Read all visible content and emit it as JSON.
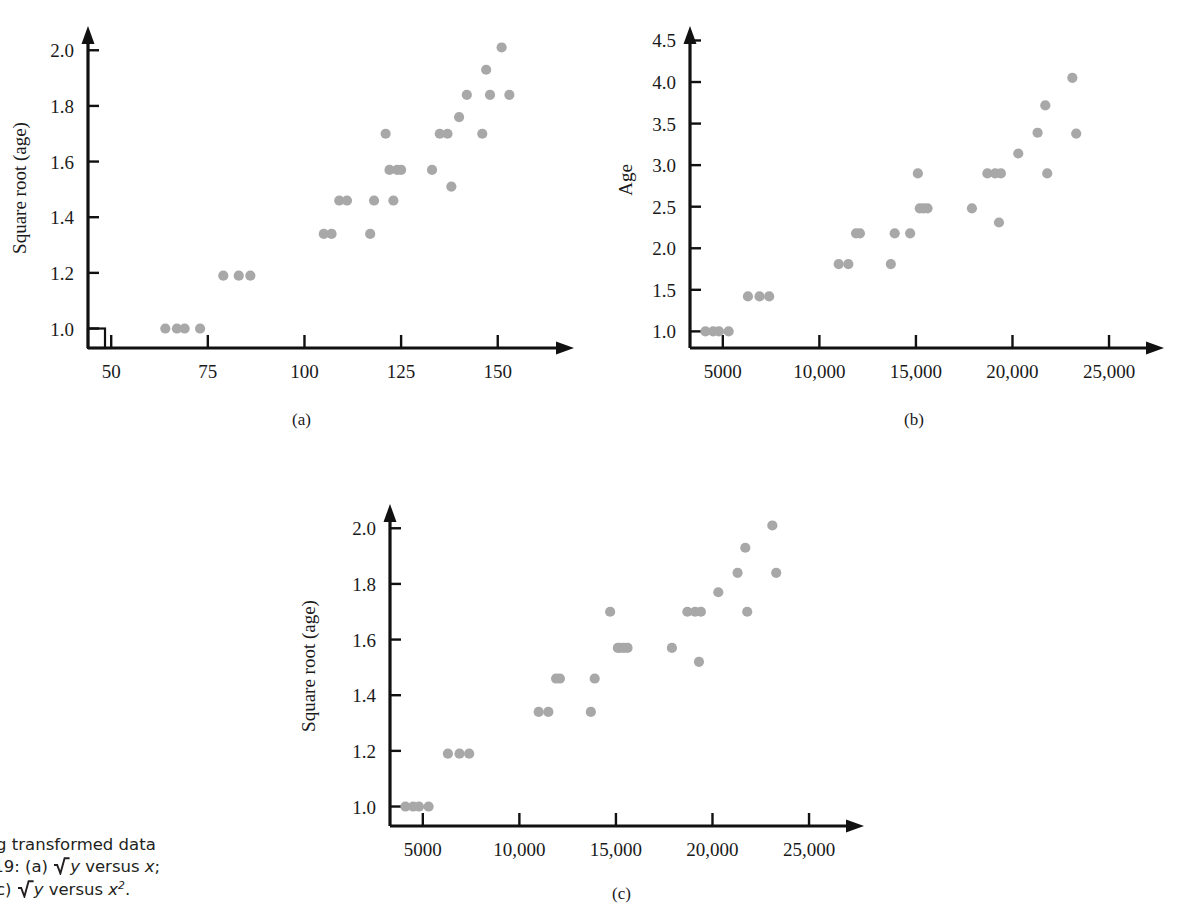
{
  "figure": {
    "number": "40",
    "caption_lines": [
      "using transformed data",
      "e 5.19: (a) √y versus x;",
      "x²; (c) √y versus x²."
    ],
    "caption_plain": "Figure 5.40  Scatterplots using transformed data for the data of Figure 5.19: (a) √y versus x; (b) y versus x²; (c) √y versus x²."
  },
  "style": {
    "marker_color": "#a8a8a8",
    "axis_color": "#111111",
    "background": "#ffffff"
  },
  "panels": [
    {
      "key": "a",
      "letter": "(a)"
    },
    {
      "key": "b",
      "letter": "(b)"
    },
    {
      "key": "c",
      "letter": "(c)"
    }
  ],
  "chart_data": [
    {
      "type": "scatter",
      "panel": "(a)",
      "title": "",
      "xlabel": "Carapace length",
      "ylabel": "Square root (age)",
      "xlim": [
        44,
        163
      ],
      "ylim": [
        0.93,
        2.08
      ],
      "xticks": [
        50,
        75,
        100,
        125,
        150
      ],
      "xticklabels": [
        "50",
        "75",
        "100",
        "125",
        "150"
      ],
      "yticks": [
        1.0,
        1.2,
        1.4,
        1.6,
        1.8,
        2.0
      ],
      "yticklabels": [
        "1.0",
        "1.2",
        "1.4",
        "1.6",
        "1.8",
        "2.0"
      ],
      "axis_break": true,
      "grid": false,
      "legend": "none",
      "x": [
        64,
        67,
        69,
        73,
        79,
        83,
        86,
        105,
        107,
        109,
        111,
        117,
        118,
        121,
        122,
        123,
        124,
        125,
        133,
        135,
        137,
        138,
        140,
        142,
        146,
        147,
        148,
        151,
        153
      ],
      "y": [
        1.0,
        1.0,
        1.0,
        1.0,
        1.19,
        1.19,
        1.19,
        1.34,
        1.34,
        1.46,
        1.46,
        1.34,
        1.46,
        1.7,
        1.57,
        1.46,
        1.57,
        1.57,
        1.57,
        1.7,
        1.7,
        1.51,
        1.76,
        1.84,
        1.7,
        1.93,
        1.84,
        2.01,
        1.84
      ]
    },
    {
      "type": "scatter",
      "panel": "(b)",
      "title": "",
      "xlabel": "Length squared",
      "ylabel": "Age",
      "xlim": [
        3300,
        26500
      ],
      "ylim": [
        0.8,
        4.65
      ],
      "xticks": [
        5000,
        10000,
        15000,
        20000,
        25000
      ],
      "xticklabels": [
        "5000",
        "10,000",
        "15,000",
        "20,000",
        "25,000"
      ],
      "yticks": [
        1.0,
        1.5,
        2.0,
        2.5,
        3.0,
        3.5,
        4.0,
        4.5
      ],
      "yticklabels": [
        "1.0",
        "1.5",
        "2.0",
        "2.5",
        "3.0",
        "3.5",
        "4.0",
        "4.5"
      ],
      "axis_break": false,
      "grid": false,
      "legend": "none",
      "x": [
        4100,
        4500,
        4800,
        5300,
        6300,
        6900,
        7400,
        11000,
        11500,
        11900,
        12100,
        13700,
        13900,
        14700,
        15100,
        15200,
        15400,
        15600,
        17900,
        18700,
        19100,
        19300,
        19400,
        20300,
        21300,
        21700,
        21800,
        23100,
        23300
      ],
      "y": [
        1.0,
        1.0,
        1.0,
        1.0,
        1.42,
        1.42,
        1.42,
        1.81,
        1.81,
        2.18,
        2.18,
        1.81,
        2.18,
        2.18,
        2.9,
        2.48,
        2.48,
        2.48,
        2.48,
        2.9,
        2.9,
        2.31,
        2.9,
        3.14,
        3.39,
        3.72,
        2.9,
        4.05,
        3.38
      ]
    },
    {
      "type": "scatter",
      "panel": "(c)",
      "title": "",
      "xlabel": "Length squared",
      "ylabel": "Square root (age)",
      "xlim": [
        3300,
        26500
      ],
      "ylim": [
        0.93,
        2.08
      ],
      "xticks": [
        5000,
        10000,
        15000,
        20000,
        25000
      ],
      "xticklabels": [
        "5000",
        "10,000",
        "15,000",
        "20,000",
        "25,000"
      ],
      "yticks": [
        1.0,
        1.2,
        1.4,
        1.6,
        1.8,
        2.0
      ],
      "yticklabels": [
        "1.0",
        "1.2",
        "1.4",
        "1.6",
        "1.8",
        "2.0"
      ],
      "axis_break": false,
      "grid": false,
      "legend": "none",
      "x": [
        4100,
        4500,
        4800,
        5300,
        6300,
        6900,
        7400,
        11000,
        11500,
        11900,
        12100,
        13700,
        13900,
        14700,
        15100,
        15200,
        15400,
        15600,
        17900,
        18700,
        19100,
        19300,
        19400,
        20300,
        21300,
        21700,
        21800,
        23100,
        23300
      ],
      "y": [
        1.0,
        1.0,
        1.0,
        1.0,
        1.19,
        1.19,
        1.19,
        1.34,
        1.34,
        1.46,
        1.46,
        1.34,
        1.46,
        1.7,
        1.57,
        1.57,
        1.57,
        1.57,
        1.57,
        1.7,
        1.7,
        1.52,
        1.7,
        1.77,
        1.84,
        1.93,
        1.7,
        2.01,
        1.84
      ]
    }
  ]
}
